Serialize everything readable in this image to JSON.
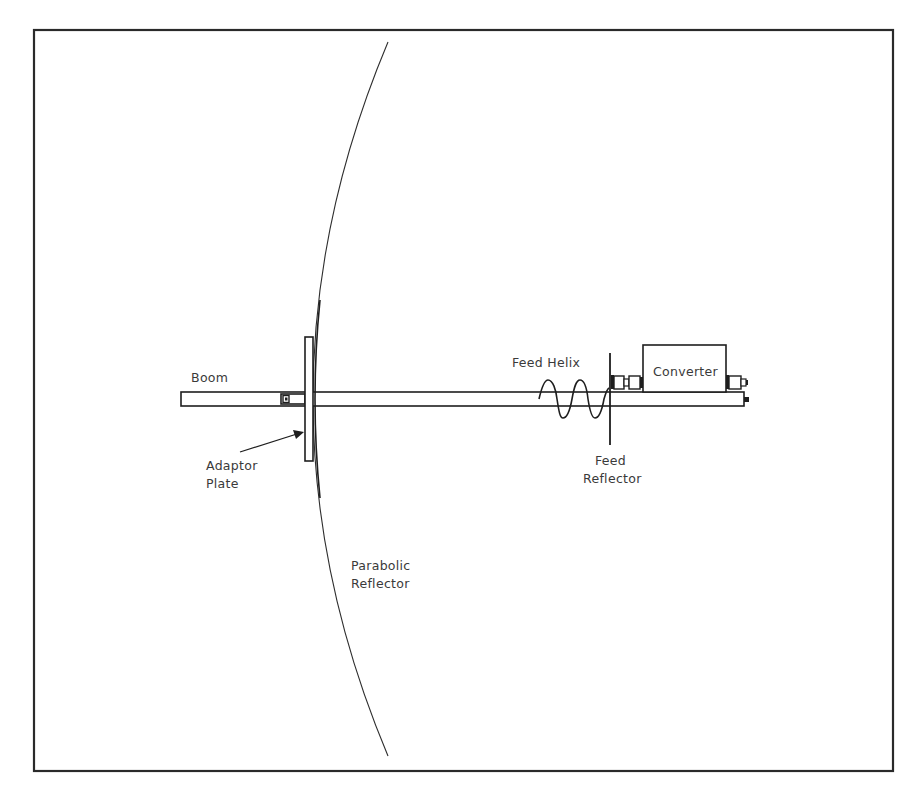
{
  "diagram": {
    "colors": {
      "background": "#ffffff",
      "line": "#1e1e1e",
      "text": "#3a3a3a",
      "reflector_curve": "#555555"
    },
    "frame": {
      "x": 34,
      "y": 30,
      "width": 859,
      "height": 741
    },
    "labels": {
      "boom": "Boom",
      "adaptor_plate_line1": "Adaptor",
      "adaptor_plate_line2": "Plate",
      "parabolic_reflector_line1": "Parabolic",
      "parabolic_reflector_line2": "Reflector",
      "feed_helix": "Feed Helix",
      "feed_reflector_line1": "Feed",
      "feed_reflector_line2": "Reflector",
      "converter": "Converter"
    },
    "components": [
      {
        "id": "boom",
        "name": "Boom",
        "x1": 181,
        "x2": 744,
        "y_top": 392,
        "y_bottom": 406
      },
      {
        "id": "adaptor-plate",
        "name": "Adaptor Plate",
        "x": 305,
        "y": 337,
        "width": 8,
        "height": 124
      },
      {
        "id": "parabolic-reflector",
        "name": "Parabolic Reflector",
        "top": [
          388,
          42
        ],
        "vertex": [
          313,
          399
        ],
        "bottom": [
          388,
          756
        ]
      },
      {
        "id": "feed-helix",
        "name": "Feed Helix",
        "x_start": 539,
        "x_end": 609,
        "turns": 2
      },
      {
        "id": "feed-reflector",
        "name": "Feed Reflector",
        "x": 610,
        "y1": 353,
        "y2": 445
      },
      {
        "id": "converter",
        "name": "Converter",
        "x": 643,
        "y": 345,
        "width": 83,
        "height": 47
      }
    ]
  }
}
